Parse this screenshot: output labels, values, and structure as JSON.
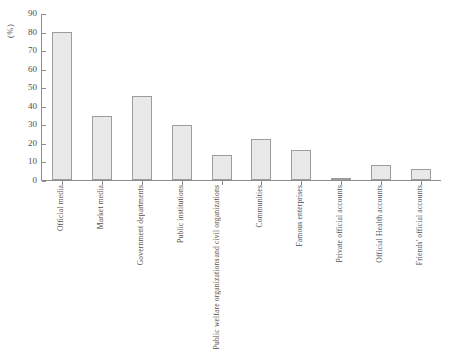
{
  "chart_data": {
    "type": "bar",
    "title": "",
    "xlabel": "",
    "ylabel": "(%)",
    "ylim": [
      0,
      90
    ],
    "ytick_step": 10,
    "yticks": [
      0,
      10,
      20,
      30,
      40,
      50,
      60,
      70,
      80,
      90
    ],
    "grid": false,
    "legend": null,
    "bar_fill_color": "#e9e9e9",
    "bar_border_color": "#9c9c9c",
    "axis_color": "#8d8d8d",
    "categories": [
      "Official media",
      "Market media",
      "Government departments",
      "Public institutions",
      "Public welfare organizations and civil organizations",
      "Communities",
      "Famous enterprises",
      "Private official accounts",
      "Official Health accounts",
      "Friends' official accounts"
    ],
    "category_lines": [
      [
        "Official media"
      ],
      [
        "Market media"
      ],
      [
        "Government departments"
      ],
      [
        "Public institutions"
      ],
      [
        "Public welfare organizations",
        "and civil organizations"
      ],
      [
        "Communities"
      ],
      [
        "Famous enterprises"
      ],
      [
        "Private official accounts"
      ],
      [
        "Official Health accounts"
      ],
      [
        "Friends' official accounts"
      ]
    ],
    "values": [
      79.8,
      34.4,
      45.3,
      29.6,
      13.6,
      22.3,
      16.2,
      1.2,
      8.3,
      5.8
    ]
  }
}
